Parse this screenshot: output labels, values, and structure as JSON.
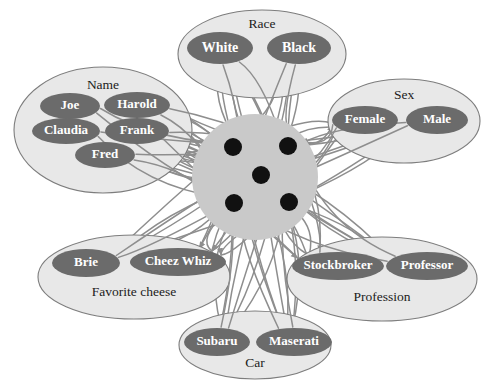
{
  "diagram": {
    "colors": {
      "background": "#ffffff",
      "group_fill": "#e8e8e8",
      "group_stroke": "#7d7d7d",
      "node_fill": "#6b6b6b",
      "node_text": "#ffffff",
      "hub_fill": "#c9c9c9",
      "hub_dot": "#111111",
      "edge": "#8e8e8e",
      "group_label_text": "#1b1b1b"
    },
    "groups": [
      {
        "id": "race",
        "label": "Race",
        "label_pos": "top",
        "ellipse": {
          "cx": 262,
          "cy": 54,
          "rx": 84,
          "ry": 44
        },
        "label_xy": {
          "x": 262,
          "y": 25
        },
        "nodes": [
          {
            "id": "white",
            "label": "White",
            "cx": 220,
            "cy": 48,
            "rx": 33,
            "ry": 16,
            "font_size": 14
          },
          {
            "id": "black",
            "label": "Black",
            "cx": 299,
            "cy": 48,
            "rx": 32,
            "ry": 16,
            "font_size": 14
          }
        ]
      },
      {
        "id": "name",
        "label": "Name",
        "label_pos": "top",
        "ellipse": {
          "cx": 103,
          "cy": 130,
          "rx": 89,
          "ry": 63
        },
        "label_xy": {
          "x": 103,
          "y": 86
        },
        "nodes": [
          {
            "id": "joe",
            "label": "Joe",
            "cx": 70,
            "cy": 106,
            "rx": 30,
            "ry": 13,
            "font_size": 13
          },
          {
            "id": "harold",
            "label": "Harold",
            "cx": 137,
            "cy": 105,
            "rx": 33,
            "ry": 13,
            "font_size": 13
          },
          {
            "id": "claudia",
            "label": "Claudia",
            "cx": 66,
            "cy": 131,
            "rx": 34,
            "ry": 13,
            "font_size": 13
          },
          {
            "id": "frank",
            "label": "Frank",
            "cx": 137,
            "cy": 131,
            "rx": 32,
            "ry": 13,
            "font_size": 13
          },
          {
            "id": "fred",
            "label": "Fred",
            "cx": 105,
            "cy": 155,
            "rx": 30,
            "ry": 13,
            "font_size": 13
          }
        ]
      },
      {
        "id": "sex",
        "label": "Sex",
        "label_pos": "top",
        "ellipse": {
          "cx": 404,
          "cy": 121,
          "rx": 76,
          "ry": 42
        },
        "label_xy": {
          "x": 404,
          "y": 96
        },
        "nodes": [
          {
            "id": "female",
            "label": "Female",
            "cx": 365,
            "cy": 120,
            "rx": 33,
            "ry": 14,
            "font_size": 13
          },
          {
            "id": "male",
            "label": "Male",
            "cx": 437,
            "cy": 120,
            "rx": 31,
            "ry": 14,
            "font_size": 13
          }
        ]
      },
      {
        "id": "cheese",
        "label": "Favorite cheese",
        "label_pos": "bottom",
        "ellipse": {
          "cx": 134,
          "cy": 277,
          "rx": 96,
          "ry": 42
        },
        "label_xy": {
          "x": 134,
          "y": 293
        },
        "nodes": [
          {
            "id": "brie",
            "label": "Brie",
            "cx": 86,
            "cy": 263,
            "rx": 34,
            "ry": 14,
            "font_size": 13
          },
          {
            "id": "cheez-whiz",
            "label": "Cheez Whiz",
            "cx": 178,
            "cy": 262,
            "rx": 48,
            "ry": 14,
            "font_size": 13
          }
        ]
      },
      {
        "id": "profession",
        "label": "Profession",
        "label_pos": "bottom",
        "ellipse": {
          "cx": 382,
          "cy": 279,
          "rx": 95,
          "ry": 42
        },
        "label_xy": {
          "x": 382,
          "y": 298
        },
        "nodes": [
          {
            "id": "stockbroker",
            "label": "Stockbroker",
            "cx": 338,
            "cy": 266,
            "rx": 46,
            "ry": 14,
            "font_size": 13
          },
          {
            "id": "professor",
            "label": "Professor",
            "cx": 427,
            "cy": 266,
            "rx": 41,
            "ry": 14,
            "font_size": 13
          }
        ]
      },
      {
        "id": "car",
        "label": "Car",
        "label_pos": "bottom",
        "ellipse": {
          "cx": 255,
          "cy": 345,
          "rx": 76,
          "ry": 34
        },
        "label_xy": {
          "x": 255,
          "y": 364
        },
        "nodes": [
          {
            "id": "subaru",
            "label": "Subaru",
            "cx": 217,
            "cy": 342,
            "rx": 33,
            "ry": 14,
            "font_size": 13
          },
          {
            "id": "maserati",
            "label": "Maserati",
            "cx": 294,
            "cy": 342,
            "rx": 38,
            "ry": 14,
            "font_size": 13
          }
        ]
      }
    ],
    "hub": {
      "id": "hidden-units",
      "circle": {
        "cx": 255,
        "cy": 177,
        "r": 63
      },
      "units": [
        {
          "id": "hidden-unit-1",
          "cx": 233,
          "cy": 147,
          "r": 9
        },
        {
          "id": "hidden-unit-2",
          "cx": 288,
          "cy": 146,
          "r": 9
        },
        {
          "id": "hidden-unit-3",
          "cx": 261,
          "cy": 175,
          "r": 9
        },
        {
          "id": "hidden-unit-4",
          "cx": 234,
          "cy": 203,
          "r": 9
        },
        {
          "id": "hidden-unit-5",
          "cx": 289,
          "cy": 202,
          "r": 9
        }
      ]
    }
  }
}
